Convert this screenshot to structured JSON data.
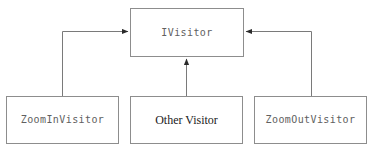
{
  "diagram": {
    "type": "uml-class-inheritance",
    "background_color": "#ffffff",
    "node_border_color": "#8d8d8d",
    "edge_color": "#7a7a7a",
    "nodes": [
      {
        "id": "ivisitor",
        "label": "IVisitor",
        "role": "interface",
        "font": "monospace",
        "x": 130,
        "y": 8,
        "width": 114,
        "height": 49
      },
      {
        "id": "zoomin",
        "label": "ZoomInVisitor",
        "role": "implementation",
        "font": "monospace",
        "x": 6,
        "y": 96,
        "width": 113,
        "height": 48
      },
      {
        "id": "other",
        "label": "Other Visitor",
        "role": "implementation",
        "font": "serif",
        "x": 130,
        "y": 96,
        "width": 113,
        "height": 48
      },
      {
        "id": "zoomout",
        "label": "ZoomOutVisitor",
        "role": "implementation",
        "font": "monospace",
        "x": 254,
        "y": 96,
        "width": 113,
        "height": 48
      }
    ],
    "edges": [
      {
        "id": "edge-zoomin-ivisitor",
        "from": "zoomin",
        "to": "ivisitor",
        "relation": "implements",
        "arrow": "right",
        "route": "elbow-left"
      },
      {
        "id": "edge-other-ivisitor",
        "from": "other",
        "to": "ivisitor",
        "relation": "implements",
        "arrow": "up",
        "route": "straight-vertical"
      },
      {
        "id": "edge-zoomout-ivisitor",
        "from": "zoomout",
        "to": "ivisitor",
        "relation": "implements",
        "arrow": "left",
        "route": "elbow-right"
      }
    ]
  }
}
